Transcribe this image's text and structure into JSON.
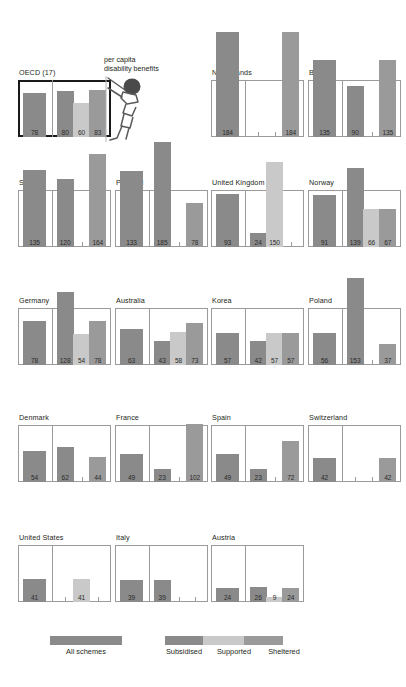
{
  "colors": {
    "all_schemes": "#8a8a8a",
    "subsidised": "#8a8a8a",
    "supported": "#c9c9c9",
    "sheltered": "#9a9a9a",
    "panel_border": "#9b9b9b",
    "highlight_border": "#1a1a1a",
    "text": "#231f20"
  },
  "annotation": {
    "line1": "per capita",
    "line2": "disability benefits",
    "figure_icon": "stick-figure-person-icon"
  },
  "legend": {
    "all_label": "All schemes",
    "items": [
      {
        "label": "Subsidised",
        "color": "#8a8a8a"
      },
      {
        "label": "Supported",
        "color": "#c9c9c9"
      },
      {
        "label": "Sheltered",
        "color": "#9a9a9a"
      }
    ]
  },
  "chart_data": {
    "type": "bar",
    "title": "",
    "xlabel": "",
    "ylabel": "per capita disability benefits",
    "ylim": [
      0,
      100
    ],
    "grid": false,
    "legend_position": "bottom",
    "series_names": [
      "All schemes",
      "Subsidised",
      "Supported",
      "Sheltered"
    ],
    "note": "Each country panel shows one left bar (All schemes) and up to three right bars (Subsidised, Supported, Sheltered). Panel box top edge equals 100; bars above 100 overflow the box.",
    "panels": [
      {
        "name": "OECD (17)",
        "highlight": true,
        "all": 78,
        "subsidised": 80,
        "supported": 60,
        "sheltered": 83
      },
      {
        "name": "Netherlands",
        "highlight": false,
        "all": 184,
        "subsidised": null,
        "supported": null,
        "sheltered": 184
      },
      {
        "name": "Belgium",
        "highlight": false,
        "all": 135,
        "subsidised": 90,
        "supported": null,
        "sheltered": 135
      },
      {
        "name": "Sweden",
        "highlight": false,
        "all": 135,
        "subsidised": 120,
        "supported": null,
        "sheltered": 164
      },
      {
        "name": "Portugal",
        "highlight": false,
        "all": 133,
        "subsidised": 185,
        "supported": null,
        "sheltered": 78
      },
      {
        "name": "United Kingdom",
        "highlight": false,
        "all": 93,
        "subsidised": 24,
        "supported": 150,
        "sheltered": null
      },
      {
        "name": "Norway",
        "highlight": false,
        "all": 91,
        "subsidised": 139,
        "supported": 66,
        "sheltered": 67
      },
      {
        "name": "Germany",
        "highlight": false,
        "all": 78,
        "subsidised": 128,
        "supported": 54,
        "sheltered": 78
      },
      {
        "name": "Australia",
        "highlight": false,
        "all": 63,
        "subsidised": 43,
        "supported": 58,
        "sheltered": 73
      },
      {
        "name": "Korea",
        "highlight": false,
        "all": 57,
        "subsidised": 42,
        "supported": 57,
        "sheltered": 57
      },
      {
        "name": "Poland",
        "highlight": false,
        "all": 56,
        "subsidised": 153,
        "supported": null,
        "sheltered": 37
      },
      {
        "name": "Denmark",
        "highlight": false,
        "all": 54,
        "subsidised": 62,
        "supported": null,
        "sheltered": 44
      },
      {
        "name": "France",
        "highlight": false,
        "all": 49,
        "subsidised": 23,
        "supported": null,
        "sheltered": 102
      },
      {
        "name": "Spain",
        "highlight": false,
        "all": 49,
        "subsidised": 23,
        "supported": null,
        "sheltered": 72
      },
      {
        "name": "Switzerland",
        "highlight": false,
        "all": 42,
        "subsidised": null,
        "supported": null,
        "sheltered": 42
      },
      {
        "name": "United States",
        "highlight": false,
        "all": 41,
        "subsidised": null,
        "supported": 41,
        "sheltered": null
      },
      {
        "name": "Italy",
        "highlight": false,
        "all": 39,
        "subsidised": 39,
        "supported": null,
        "sheltered": null
      },
      {
        "name": "Austria",
        "highlight": false,
        "all": 24,
        "subsidised": 26,
        "supported": 9,
        "sheltered": 24
      }
    ]
  },
  "layout": {
    "panel_w": 93,
    "panel_h": 57,
    "col_x": [
      18,
      115,
      211,
      308
    ],
    "row_y": [
      80,
      190,
      308,
      425,
      545
    ],
    "grid": [
      {
        "panel": 0,
        "col": 0,
        "row": 0
      },
      {
        "panel": 1,
        "col": 2,
        "row": 0
      },
      {
        "panel": 2,
        "col": 3,
        "row": 0
      },
      {
        "panel": 3,
        "col": 0,
        "row": 1
      },
      {
        "panel": 4,
        "col": 1,
        "row": 1
      },
      {
        "panel": 5,
        "col": 2,
        "row": 1
      },
      {
        "panel": 6,
        "col": 3,
        "row": 1
      },
      {
        "panel": 7,
        "col": 0,
        "row": 2
      },
      {
        "panel": 8,
        "col": 1,
        "row": 2
      },
      {
        "panel": 9,
        "col": 2,
        "row": 2
      },
      {
        "panel": 10,
        "col": 3,
        "row": 2
      },
      {
        "panel": 11,
        "col": 0,
        "row": 3
      },
      {
        "panel": 12,
        "col": 1,
        "row": 3
      },
      {
        "panel": 13,
        "col": 2,
        "row": 3
      },
      {
        "panel": 14,
        "col": 3,
        "row": 3
      },
      {
        "panel": 15,
        "col": 0,
        "row": 4
      },
      {
        "panel": 16,
        "col": 1,
        "row": 4
      },
      {
        "panel": 17,
        "col": 2,
        "row": 4
      }
    ]
  }
}
